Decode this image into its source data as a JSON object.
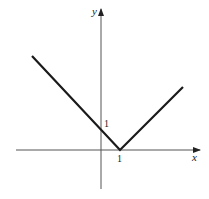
{
  "diagram": {
    "type": "function-graph",
    "function": "y = |x - 1|",
    "axes": {
      "x_label": "x",
      "y_label": "y",
      "origin_px": [
        101,
        150
      ],
      "unit_px": 19
    },
    "tick_labels": {
      "x_tick": "1",
      "y_tick": "1"
    },
    "points": {
      "vertex": [
        1,
        0
      ],
      "y_intercept": [
        0,
        1
      ],
      "left_end": [
        -3.6,
        4.6
      ],
      "right_end": [
        4.3,
        3.3
      ]
    },
    "colors": {
      "curve": "#1a1a1a",
      "axis": "#555555",
      "label": "#222222"
    }
  }
}
